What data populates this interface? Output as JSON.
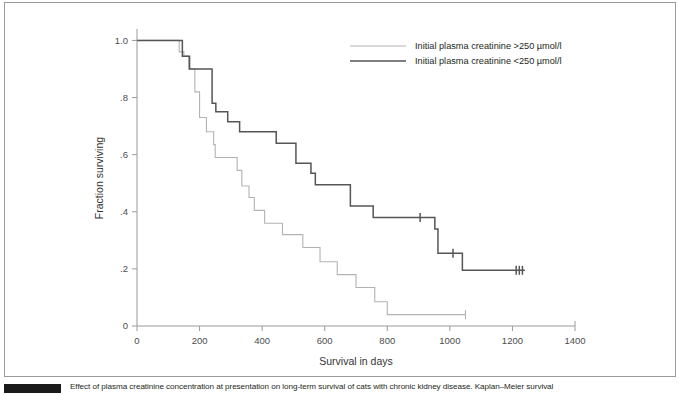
{
  "figure": {
    "caption_text": "Effect of plasma creatinine concentration at presentation on long-term survival of cats with chronic kidney disease. Kaplan–Meier survival",
    "badge_name": "figure-number-badge"
  },
  "chart_data": {
    "type": "line",
    "subtype": "kaplan-meier-step",
    "title": "",
    "xlabel": "Survival in days",
    "ylabel": "Fraction surviving",
    "xlim": [
      0,
      1400
    ],
    "ylim": [
      0,
      1.04
    ],
    "xticks": [
      0,
      200,
      400,
      600,
      800,
      1000,
      1200,
      1400
    ],
    "xtick_labels": [
      "0",
      "200",
      "400",
      "600",
      "800",
      "1000",
      "1200",
      "1400"
    ],
    "yticks": [
      0,
      0.2,
      0.4,
      0.6,
      0.8,
      1.0
    ],
    "ytick_labels": [
      "0",
      ".2",
      ".4",
      ".6",
      ".8",
      "1.0"
    ],
    "grid": false,
    "legend_position": "top-right",
    "series": [
      {
        "name": "Initial plasma creatinine >250 µmol/l",
        "color": "#b3b3b3",
        "linewidth": 1.1,
        "points": [
          [
            0,
            1.0
          ],
          [
            130,
            1.0
          ],
          [
            135,
            0.96
          ],
          [
            150,
            0.945
          ],
          [
            165,
            0.9
          ],
          [
            185,
            0.82
          ],
          [
            200,
            0.73
          ],
          [
            222,
            0.68
          ],
          [
            245,
            0.635
          ],
          [
            250,
            0.59
          ],
          [
            300,
            0.59
          ],
          [
            320,
            0.545
          ],
          [
            335,
            0.49
          ],
          [
            358,
            0.45
          ],
          [
            375,
            0.405
          ],
          [
            400,
            0.405
          ],
          [
            408,
            0.36
          ],
          [
            455,
            0.36
          ],
          [
            465,
            0.32
          ],
          [
            520,
            0.32
          ],
          [
            530,
            0.275
          ],
          [
            575,
            0.275
          ],
          [
            585,
            0.225
          ],
          [
            625,
            0.225
          ],
          [
            640,
            0.18
          ],
          [
            690,
            0.18
          ],
          [
            700,
            0.135
          ],
          [
            750,
            0.135
          ],
          [
            760,
            0.085
          ],
          [
            793,
            0.085
          ],
          [
            800,
            0.04
          ],
          [
            1050,
            0.04
          ]
        ],
        "censor_marks": [
          [
            1050,
            0.04
          ]
        ],
        "final_value": 0.04,
        "final_time": 1050
      },
      {
        "name": "Initial plasma creatinine <250 µmol/l",
        "color": "#555555",
        "linewidth": 1.5,
        "points": [
          [
            0,
            1.0
          ],
          [
            138,
            1.0
          ],
          [
            145,
            0.945
          ],
          [
            168,
            0.9
          ],
          [
            230,
            0.9
          ],
          [
            240,
            0.78
          ],
          [
            252,
            0.75
          ],
          [
            280,
            0.75
          ],
          [
            290,
            0.715
          ],
          [
            318,
            0.715
          ],
          [
            328,
            0.68
          ],
          [
            432,
            0.68
          ],
          [
            445,
            0.64
          ],
          [
            497,
            0.64
          ],
          [
            508,
            0.57
          ],
          [
            545,
            0.57
          ],
          [
            556,
            0.535
          ],
          [
            570,
            0.495
          ],
          [
            672,
            0.495
          ],
          [
            682,
            0.42
          ],
          [
            745,
            0.42
          ],
          [
            755,
            0.38
          ],
          [
            940,
            0.38
          ],
          [
            952,
            0.34
          ],
          [
            962,
            0.255
          ],
          [
            1032,
            0.255
          ],
          [
            1040,
            0.195
          ],
          [
            1240,
            0.195
          ]
        ],
        "censor_marks": [
          [
            905,
            0.38
          ],
          [
            1010,
            0.255
          ],
          [
            1212,
            0.195
          ],
          [
            1222,
            0.195
          ],
          [
            1232,
            0.195
          ]
        ],
        "final_value": 0.195,
        "final_time": 1240
      }
    ]
  },
  "legend": {
    "entries": [
      {
        "label": "Initial plasma creatinine >250 µmol/l",
        "color": "#b3b3b3"
      },
      {
        "label": "Initial plasma creatinine <250 µmol/l",
        "color": "#555555"
      }
    ]
  },
  "colors": {
    "axis": "#9a9a9a",
    "tick_text": "#4c4c4c",
    "frame": "#9a9a9a",
    "caption": "#231f20"
  }
}
